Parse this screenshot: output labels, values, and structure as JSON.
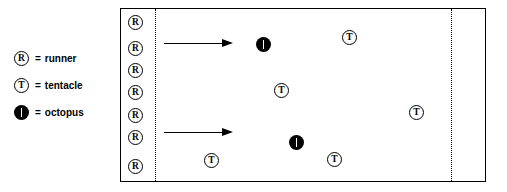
{
  "figure": {
    "colors": {
      "ink": "#000000",
      "paper": "#ffffff"
    }
  },
  "legend": {
    "equals": "=",
    "items": [
      {
        "symbol": "R",
        "symbol_kind": "circled-letter-outline",
        "icon_name": "runner-icon",
        "label": "runner"
      },
      {
        "symbol": "T",
        "symbol_kind": "circled-letter-outline",
        "icon_name": "tentacle-icon",
        "label": "tentacle"
      },
      {
        "symbol": "O",
        "symbol_kind": "filled-circle-slit",
        "icon_name": "octopus-icon",
        "label": "octopus"
      }
    ]
  },
  "field": {
    "start_line_label": "",
    "finish_line_label": "",
    "runners": [
      {
        "symbol": "R",
        "x": 7,
        "y": 6
      },
      {
        "symbol": "R",
        "x": 7,
        "y": 32
      },
      {
        "symbol": "R",
        "x": 7,
        "y": 54
      },
      {
        "symbol": "R",
        "x": 7,
        "y": 76
      },
      {
        "symbol": "R",
        "x": 7,
        "y": 99
      },
      {
        "symbol": "R",
        "x": 7,
        "y": 121
      },
      {
        "symbol": "R",
        "x": 7,
        "y": 150
      }
    ],
    "tentacles": [
      {
        "symbol": "T",
        "x": 221,
        "y": 21
      },
      {
        "symbol": "T",
        "x": 153,
        "y": 74
      },
      {
        "symbol": "T",
        "x": 288,
        "y": 96
      },
      {
        "symbol": "T",
        "x": 83,
        "y": 144
      },
      {
        "symbol": "T",
        "x": 206,
        "y": 143
      }
    ],
    "octopuses": [
      {
        "symbol": "O",
        "x": 135,
        "y": 28
      },
      {
        "symbol": "O",
        "x": 168,
        "y": 111
      }
    ],
    "arrows": [
      {
        "name": "arrow-top",
        "x": 43,
        "y": 30,
        "length": 69
      },
      {
        "name": "arrow-bottom",
        "x": 43,
        "y": 119,
        "length": 69
      }
    ]
  }
}
